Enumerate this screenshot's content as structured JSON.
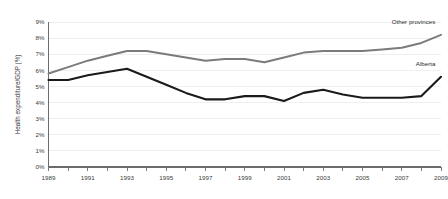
{
  "chart_data": {
    "type": "line",
    "title": "",
    "subtitle": "",
    "xlabel": "",
    "ylabel": "Health expenditure/GDP (%)",
    "x": [
      1989,
      1990,
      1991,
      1992,
      1993,
      1994,
      1995,
      1996,
      1997,
      1998,
      1999,
      2000,
      2001,
      2002,
      2003,
      2004,
      2005,
      2006,
      2007,
      2008,
      2009
    ],
    "xtick_labels": [
      "1989",
      "",
      "1991",
      "",
      "1993",
      "",
      "1995",
      "",
      "1997",
      "",
      "1999",
      "",
      "2001",
      "",
      "2003",
      "",
      "2005",
      "",
      "2007",
      "",
      "2009"
    ],
    "xtick_labels_shown": [
      "1989",
      "1991",
      "1993",
      "1995",
      "1997",
      "1999",
      "2001",
      "2003",
      "2005",
      "2007",
      "2009"
    ],
    "ytick_labels": [
      "0%",
      "1%",
      "2%",
      "3%",
      "4%",
      "5%",
      "6%",
      "7%",
      "8%",
      "9%"
    ],
    "ytick_values": [
      0,
      1,
      2,
      3,
      4,
      5,
      6,
      7,
      8,
      9
    ],
    "xlim": [
      1989,
      2009
    ],
    "ylim": [
      0,
      9
    ],
    "grid": true,
    "grid_axis": "y",
    "legend": "inline-annotations",
    "series": [
      {
        "name": "Other provinces",
        "color": "#7b7b7b",
        "label_x": 2008,
        "label_y": 8.9,
        "values": [
          5.8,
          6.2,
          6.6,
          6.9,
          7.2,
          7.2,
          7.0,
          6.8,
          6.6,
          6.7,
          6.7,
          6.5,
          6.8,
          7.1,
          7.2,
          7.2,
          7.2,
          7.3,
          7.4,
          7.7,
          8.2
        ]
      },
      {
        "name": "Alberta",
        "color": "#1a1a1a",
        "label_x": 2008,
        "label_y": 6.3,
        "values": [
          5.4,
          5.4,
          5.7,
          5.9,
          6.1,
          5.6,
          5.1,
          4.6,
          4.2,
          4.2,
          4.4,
          4.4,
          4.1,
          4.6,
          4.8,
          4.5,
          4.3,
          4.3,
          4.3,
          4.4,
          5.6
        ]
      }
    ]
  },
  "axis": {
    "y_title": "Health expenditure/GDP (%)"
  },
  "annotations": {
    "other_provinces": "Other provinces",
    "alberta": "Alberta"
  }
}
